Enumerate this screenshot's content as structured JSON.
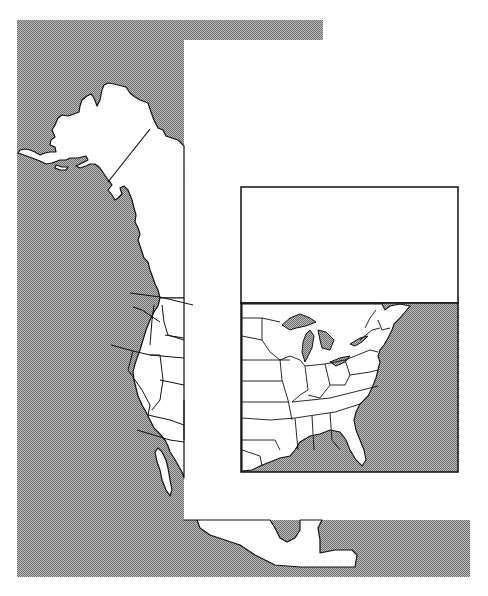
{
  "map": {
    "type": "outline map",
    "region": "North America (Alaska, Western United States, Eastern United States, Mexico)",
    "labels": [],
    "colors": {
      "water": "#9a9a9a",
      "land": "#ffffff",
      "borders": "#111111",
      "inset_border": "#111111"
    },
    "inset": {
      "description": "Eastern United States inset with blank title panel",
      "title_panel_text": ""
    }
  }
}
